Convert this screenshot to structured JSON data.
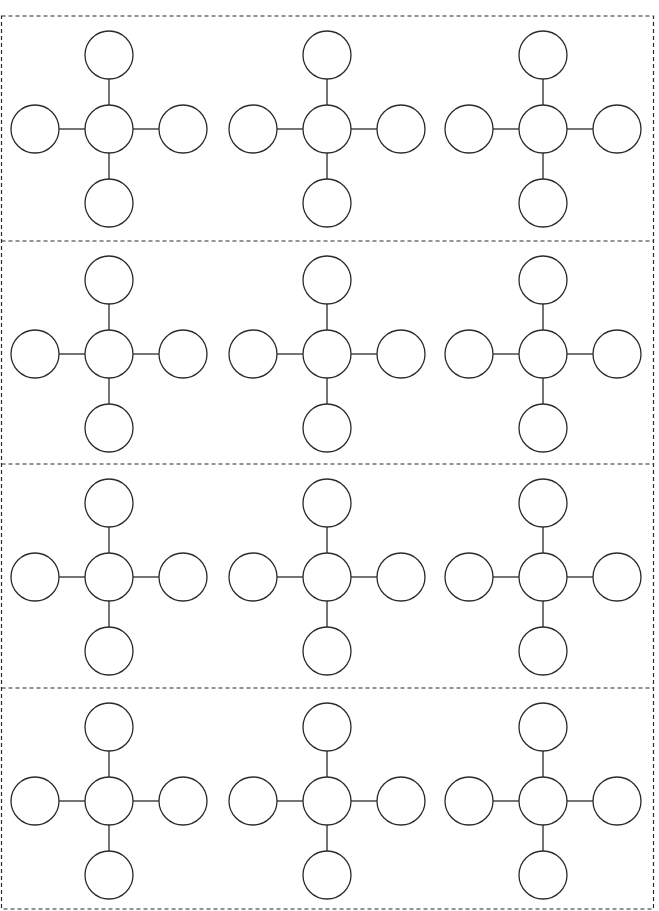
{
  "sheet": {
    "width": 659,
    "height": 911,
    "background": "#ffffff",
    "stroke_color": "#2a2a2a",
    "border": {
      "x": 1.5,
      "y": 16,
      "width": 652,
      "height": 893,
      "dash": "4 3"
    },
    "row_dividers_y": [
      241,
      464,
      688
    ],
    "rows": 4,
    "columns": 3
  },
  "diagram_template": {
    "type": "star-web",
    "circle_radius": 24,
    "arm_offset": 74,
    "nodes": [
      "center",
      "top",
      "bottom",
      "left",
      "right"
    ],
    "labels": {
      "center": "",
      "top": "",
      "bottom": "",
      "left": "",
      "right": ""
    }
  },
  "grid": {
    "column_centers_x": [
      109,
      327,
      543
    ],
    "row_centers_y": [
      129,
      354,
      577,
      801
    ]
  }
}
